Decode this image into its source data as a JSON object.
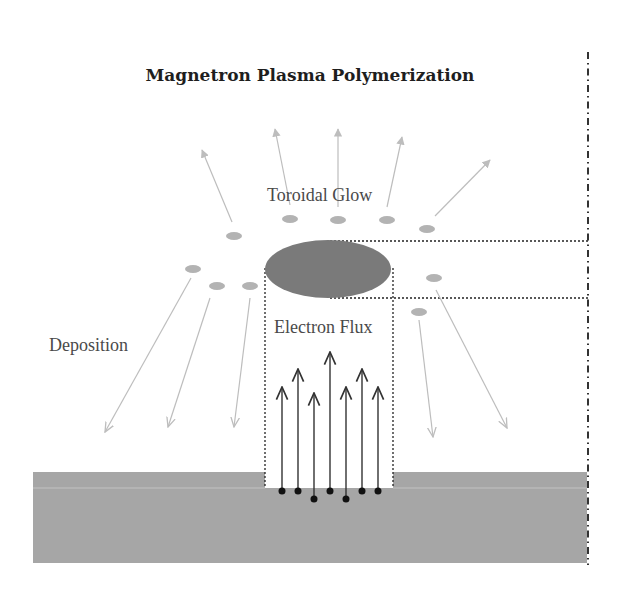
{
  "title": "Magnetron Plasma Polymerization",
  "labels": {
    "toroidal_glow": "Toroidal Glow",
    "electron_flux": "Electron Flux",
    "deposition": "Deposition"
  },
  "colors": {
    "substrate": "#a6a6a6",
    "substrate_top": "#a9a9a9",
    "glow": "#7a7a7a",
    "particle": "#b3b3b3",
    "emission_arrow": "#bdbdbd",
    "electron": "#111111",
    "electron_arrow": "#333333",
    "dotted_line": "#222222",
    "axis_line": "#333333"
  },
  "particles": [
    {
      "cx": 234,
      "cy": 236
    },
    {
      "cx": 290,
      "cy": 219
    },
    {
      "cx": 338,
      "cy": 220
    },
    {
      "cx": 387,
      "cy": 220
    },
    {
      "cx": 427,
      "cy": 229
    },
    {
      "cx": 193,
      "cy": 269
    },
    {
      "cx": 217,
      "cy": 286
    },
    {
      "cx": 250,
      "cy": 286
    },
    {
      "cx": 434,
      "cy": 278
    },
    {
      "cx": 419,
      "cy": 312
    }
  ],
  "emission_arrows": [
    {
      "x1": 232,
      "y1": 222,
      "x2": 202,
      "y2": 150
    },
    {
      "x1": 290,
      "y1": 205,
      "x2": 275,
      "y2": 129
    },
    {
      "x1": 338,
      "y1": 207,
      "x2": 338,
      "y2": 129
    },
    {
      "x1": 387,
      "y1": 207,
      "x2": 402,
      "y2": 137
    },
    {
      "x1": 435,
      "y1": 216,
      "x2": 490,
      "y2": 160
    }
  ],
  "deposition_arrows": [
    {
      "x1": 191,
      "y1": 278,
      "x2": 105,
      "y2": 432
    },
    {
      "x1": 210,
      "y1": 298,
      "x2": 168,
      "y2": 427
    },
    {
      "x1": 250,
      "y1": 298,
      "x2": 234,
      "y2": 427
    },
    {
      "x1": 419,
      "y1": 320,
      "x2": 433,
      "y2": 437
    },
    {
      "x1": 436,
      "y1": 290,
      "x2": 507,
      "y2": 428
    }
  ],
  "electron_flux": [
    {
      "x": 282,
      "dot_y": 491,
      "tip_y": 387
    },
    {
      "x": 298,
      "dot_y": 491,
      "tip_y": 369
    },
    {
      "x": 314,
      "dot_y": 499,
      "tip_y": 393
    },
    {
      "x": 330,
      "dot_y": 491,
      "tip_y": 352
    },
    {
      "x": 346,
      "dot_y": 499,
      "tip_y": 387
    },
    {
      "x": 362,
      "dot_y": 491,
      "tip_y": 369
    },
    {
      "x": 378,
      "dot_y": 491,
      "tip_y": 387
    }
  ]
}
